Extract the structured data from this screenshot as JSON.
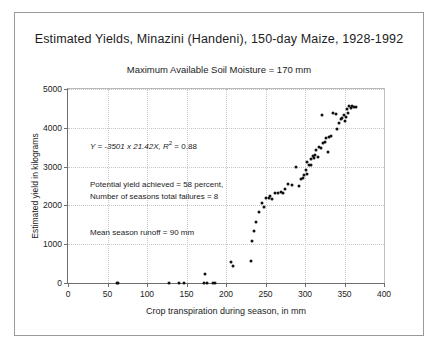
{
  "figure": {
    "title": "Estimated Yields, Minazini (Handeni), 150-day Maize, 1928-1992",
    "subtitle": "Maximum Available Soil Moisture = 170 mm"
  },
  "annotations": {
    "equation_prefix": "Y = -3501 x 21.42X, ",
    "equation_r": "R",
    "equation_sup": "2",
    "equation_value": " = 0.88",
    "potential_line1": "Potential yield achieved = 58 percent,",
    "potential_line2": "Number of seasons total failures = 8",
    "runoff": "Mean season runoff = 90 mm"
  },
  "chart_data": {
    "type": "scatter",
    "title": "Estimated Yields, Minazini (Handeni), 150-day Maize, 1928-1992",
    "subtitle": "Maximum Available Soil Moisture = 170 mm",
    "xlabel": "Crop transpiration during season, in mm",
    "ylabel": "Estimated yield in kilograms",
    "xlim": [
      0,
      400
    ],
    "ylim": [
      0,
      5000
    ],
    "xticks": [
      0,
      50,
      100,
      150,
      200,
      250,
      300,
      350,
      400
    ],
    "yticks": [
      0,
      1000,
      2000,
      3000,
      4000,
      5000
    ],
    "grid": true,
    "legend": "none",
    "marker": "filled-circle",
    "marker_color": "#111111",
    "fit": {
      "equation": "Y = -3501 x 21.42X",
      "r_squared": 0.88
    },
    "notes": [
      "Potential yield achieved = 58 percent,",
      "Number of seasons total failures = 8",
      "Mean season runoff = 90 mm"
    ],
    "series": [
      {
        "name": "Estimated yield by crop transpiration",
        "points": [
          [
            62,
            0
          ],
          [
            63,
            0
          ],
          [
            128,
            0
          ],
          [
            141,
            0
          ],
          [
            147,
            0
          ],
          [
            172,
            0
          ],
          [
            176,
            0
          ],
          [
            183,
            0
          ],
          [
            186,
            0
          ],
          [
            174,
            230
          ],
          [
            206,
            530
          ],
          [
            209,
            430
          ],
          [
            232,
            560
          ],
          [
            233,
            1090
          ],
          [
            236,
            1330
          ],
          [
            238,
            1560
          ],
          [
            242,
            1830
          ],
          [
            245,
            2050
          ],
          [
            248,
            1960
          ],
          [
            250,
            2190
          ],
          [
            254,
            2200
          ],
          [
            256,
            2240
          ],
          [
            258,
            2160
          ],
          [
            262,
            2330
          ],
          [
            266,
            2320
          ],
          [
            270,
            2350
          ],
          [
            272,
            2330
          ],
          [
            275,
            2430
          ],
          [
            279,
            2540
          ],
          [
            283,
            2520
          ],
          [
            288,
            2980
          ],
          [
            292,
            2490
          ],
          [
            295,
            2680
          ],
          [
            297,
            2700
          ],
          [
            299,
            2780
          ],
          [
            301,
            2900
          ],
          [
            302,
            2820
          ],
          [
            303,
            3120
          ],
          [
            305,
            3050
          ],
          [
            307,
            3040
          ],
          [
            308,
            3190
          ],
          [
            310,
            3280
          ],
          [
            311,
            3210
          ],
          [
            313,
            3300
          ],
          [
            314,
            3420
          ],
          [
            316,
            3260
          ],
          [
            318,
            3500
          ],
          [
            320,
            3470
          ],
          [
            321,
            4330
          ],
          [
            323,
            3620
          ],
          [
            325,
            3630
          ],
          [
            327,
            3750
          ],
          [
            329,
            3380
          ],
          [
            331,
            3760
          ],
          [
            333,
            3790
          ],
          [
            336,
            4390
          ],
          [
            339,
            4360
          ],
          [
            341,
            3980
          ],
          [
            343,
            4120
          ],
          [
            345,
            4220
          ],
          [
            347,
            4250
          ],
          [
            349,
            4340
          ],
          [
            350,
            4180
          ],
          [
            352,
            4290
          ],
          [
            353,
            4490
          ],
          [
            355,
            4380
          ],
          [
            356,
            4550
          ],
          [
            358,
            4520
          ],
          [
            360,
            4560
          ],
          [
            362,
            4530
          ],
          [
            364,
            4540
          ]
        ]
      }
    ]
  }
}
